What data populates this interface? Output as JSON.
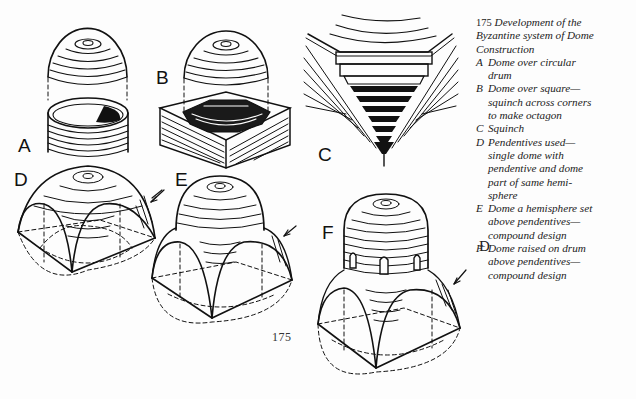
{
  "figure": {
    "number": "175",
    "caption_title": "Development of the Byzantine system of Dome Construction",
    "caption_lines": [
      "Development of the",
      "Byzantine system of Dome",
      "Construction"
    ],
    "items": [
      {
        "letter": "A",
        "text": "Dome over circular drum"
      },
      {
        "letter": "B",
        "text": "Dome over square—squinch across corners to make octagon"
      },
      {
        "letter": "C",
        "text": "Squinch"
      },
      {
        "letter": "D",
        "text": "Pendentives used—single dome with pendentive and dome part of same hemi-sphere"
      },
      {
        "letter": "E",
        "text": "Dome a hemisphere set above pendentives—compound design"
      },
      {
        "letter": "F",
        "text": "Dome raised on drum above pendentives—compound design"
      }
    ],
    "caption_rendered": {
      "A": [
        "Dome over circular",
        "drum"
      ],
      "B": [
        "Dome over square—",
        "squinch across corners",
        "to make octagon"
      ],
      "C": [
        "Squinch"
      ],
      "D": [
        "Pendentives used—",
        "single dome with",
        "pendentive and dome",
        "part of same hemi-",
        "sphere"
      ],
      "E": [
        "Dome a hemisphere set",
        "above pendentives—",
        "compound design"
      ],
      "F": [
        "Dome raised on drum",
        "above pendentives—",
        "compound design"
      ]
    }
  },
  "drawing_labels": {
    "A": "A",
    "B": "B",
    "C": "C",
    "D": "D",
    "E": "E",
    "F": "F"
  },
  "page_number": "175",
  "symbol": "Ɖ",
  "colors": {
    "ink": "#111111",
    "paper": "#fdfdfd"
  }
}
